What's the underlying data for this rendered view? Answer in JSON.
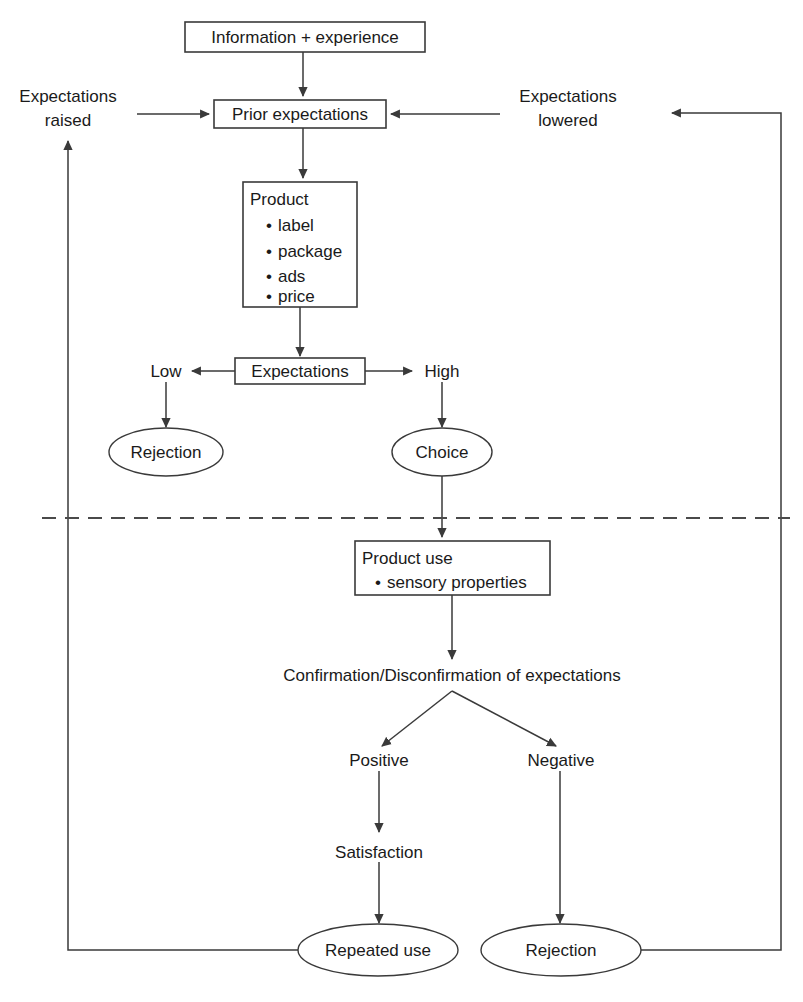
{
  "diagram": {
    "colors": {
      "background": "#ffffff",
      "stroke": "#3a3a3a",
      "text": "#1a1a1a",
      "divider": "#4a4a4a"
    },
    "nodes": {
      "information": "Information + experience",
      "prior_expectations": "Prior expectations",
      "product_title": "Product",
      "product_items": [
        "label",
        "package",
        "ads",
        "price"
      ],
      "expectations": "Expectations",
      "low": "Low",
      "high": "High",
      "rejection_top": "Rejection",
      "choice": "Choice",
      "product_use_title": "Product use",
      "product_use_items": [
        "sensory properties"
      ],
      "confirmation": "Confirmation/Disconfirmation of expectations",
      "positive": "Positive",
      "negative": "Negative",
      "satisfaction": "Satisfaction",
      "repeated_use": "Repeated use",
      "rejection_bottom": "Rejection",
      "expectations_raised_line1": "Expectations",
      "expectations_raised_line2": "raised",
      "expectations_lowered_line1": "Expectations",
      "expectations_lowered_line2": "lowered"
    },
    "bullet_glyph": "•"
  }
}
